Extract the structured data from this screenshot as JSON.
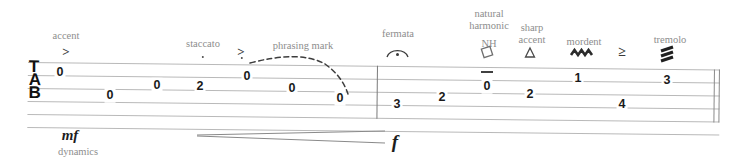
{
  "staff": {
    "clef": "TAB",
    "clef_letters": [
      "T",
      "A",
      "B"
    ],
    "line_count": 6,
    "barline_label": "measure-barline",
    "end_barline_label": "final-double-barline"
  },
  "measures": [
    {
      "index": 1,
      "notes": [
        {
          "fret": "0",
          "string": 1,
          "x": 60,
          "y": 72
        },
        {
          "fret": "0",
          "string": 3,
          "x": 110,
          "y": 95
        },
        {
          "fret": "0",
          "string": 2,
          "x": 157,
          "y": 85
        },
        {
          "fret": "2",
          "string": 2,
          "x": 200,
          "y": 86
        },
        {
          "fret": "0",
          "string": 1,
          "x": 247,
          "y": 76
        },
        {
          "fret": "0",
          "string": 2,
          "x": 292,
          "y": 88
        },
        {
          "fret": "0",
          "string": 3,
          "x": 340,
          "y": 98
        }
      ]
    },
    {
      "index": 2,
      "notes": [
        {
          "fret": "3",
          "string": 4,
          "x": 397,
          "y": 104
        },
        {
          "fret": "2",
          "string": 3,
          "x": 442,
          "y": 97
        },
        {
          "fret": "0",
          "string": 2,
          "x": 487,
          "y": 86
        },
        {
          "fret": "2",
          "string": 3,
          "x": 530,
          "y": 94
        },
        {
          "fret": "1",
          "string": 1,
          "x": 578,
          "y": 78
        },
        {
          "fret": "4",
          "string": 4,
          "x": 622,
          "y": 104
        },
        {
          "fret": "3",
          "string": 1,
          "x": 667,
          "y": 80
        }
      ]
    }
  ],
  "annotations": [
    {
      "name": "accent",
      "label": "accent",
      "glyph": ">",
      "x": 66,
      "label_y": 32,
      "glyph_y": 46
    },
    {
      "name": "staccato",
      "label": "staccato",
      "glyph": "·",
      "x": 203,
      "label_y": 40,
      "glyph_y": 55
    },
    {
      "name": "accent-staccato",
      "label": "",
      "glyph": ">",
      "x": 242,
      "label_y": 0,
      "glyph_y": 48
    },
    {
      "name": "phrasing-mark",
      "label": "phrasing mark",
      "glyph": "",
      "x": 299,
      "label_y": 42,
      "glyph_y": 0
    },
    {
      "name": "fermata",
      "label": "fermata",
      "glyph": "",
      "x": 397,
      "label_y": 30,
      "glyph_y": 46
    },
    {
      "name": "natural-harmonic",
      "label": "natural\nharmonic",
      "glyph": "NH",
      "x": 487,
      "label_y": 8,
      "glyph_y": 50
    },
    {
      "name": "sharp-accent",
      "label": "sharp\naccent",
      "glyph": "",
      "x": 530,
      "label_y": 22,
      "glyph_y": 50
    },
    {
      "name": "mordent",
      "label": "mordent",
      "glyph": "",
      "x": 581,
      "label_y": 38,
      "glyph_y": 52
    },
    {
      "name": "tenuto-accent",
      "label": "",
      "glyph": "≥",
      "x": 622,
      "label_y": 0,
      "glyph_y": 48
    },
    {
      "name": "tremolo",
      "label": "tremolo",
      "glyph": "",
      "x": 667,
      "label_y": 36,
      "glyph_y": 50
    }
  ],
  "labels": {
    "accent": "accent",
    "staccato": "staccato",
    "phrasing_mark": "phrasing mark",
    "fermata": "fermata",
    "natural_harmonic_line1": "natural",
    "natural_harmonic_line2": "harmonic",
    "natural_harmonic_abbr": "NH",
    "sharp_accent_line1": "sharp",
    "sharp_accent_line2": "accent",
    "mordent": "mordent",
    "tremolo": "tremolo",
    "dynamics": "dynamics"
  },
  "dynamics": {
    "start_marking": "mf",
    "end_marking": "f",
    "caption": "dynamics",
    "hairpin_type": "crescendo"
  },
  "colors": {
    "ink": "#1a1a1a",
    "staff_line": "#b9b9b9",
    "label_grey": "#8d8d8d",
    "background": "#ffffff"
  }
}
